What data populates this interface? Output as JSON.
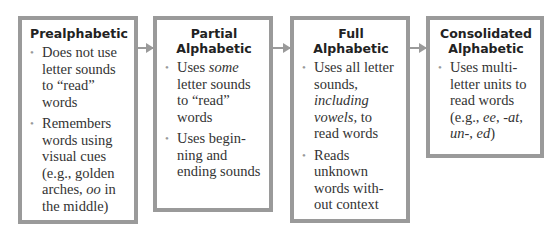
{
  "stages": [
    {
      "title": "Prealphabetic",
      "items": [
        [
          "Does not use letter sounds to “read” words"
        ],
        [
          "Remembers words using visual cues (e.g., golden arches, ",
          {
            "i": "oo"
          },
          " in the middle)"
        ]
      ]
    },
    {
      "title": "Partial Alphabetic",
      "items": [
        [
          "Uses ",
          {
            "i": "some"
          },
          " letter sounds to “read” words"
        ],
        [
          "Uses begin-ning and ending sounds"
        ]
      ]
    },
    {
      "title": "Full Alphabetic",
      "items": [
        [
          "Uses all letter sounds, ",
          {
            "i": "including vowels,"
          },
          " to read words"
        ],
        [
          "Reads unknown words with-out context"
        ]
      ]
    },
    {
      "title": "Consolidated Alphabetic",
      "items": [
        [
          "Uses multi-letter units to read words (e.g., ",
          {
            "i": "ee"
          },
          ", ",
          {
            "i": "-at"
          },
          ", ",
          {
            "i": "un-"
          },
          ", ",
          {
            "i": "ed"
          },
          ")"
        ]
      ]
    }
  ],
  "colors": {
    "border": "#9a9a9a",
    "arrow": "#9a9a9a",
    "bullet": "#999999"
  }
}
